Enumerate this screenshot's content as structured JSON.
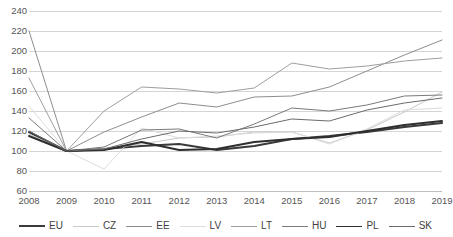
{
  "chart_data": {
    "type": "line",
    "title": "",
    "xlabel": "",
    "ylabel": "",
    "x": [
      2008,
      2009,
      2010,
      2011,
      2012,
      2013,
      2014,
      2015,
      2016,
      2017,
      2018,
      2019
    ],
    "xtick_labels": [
      "2008",
      "2009",
      "2010",
      "2011",
      "2012",
      "2013",
      "2014",
      "2015",
      "2016",
      "2017",
      "2018",
      "2019"
    ],
    "ylim": [
      60,
      240
    ],
    "ytick_labels": [
      "240",
      "220",
      "200",
      "180",
      "160",
      "140",
      "120",
      "100",
      "80",
      "60"
    ],
    "yticks": [
      240,
      220,
      200,
      180,
      160,
      140,
      120,
      100,
      80,
      60
    ],
    "grid": true,
    "legend_position": "bottom",
    "series": [
      {
        "name": "EU",
        "color": "#3a3a3a",
        "width": 2.1,
        "values": [
          119,
          100,
          102,
          105,
          107,
          101,
          105,
          112,
          115,
          119,
          124,
          128
        ]
      },
      {
        "name": "CZ",
        "color": "#c9c9c9",
        "width": 1.0,
        "values": [
          117,
          100,
          102,
          107,
          113,
          114,
          119,
          119,
          108,
          121,
          139,
          159
        ]
      },
      {
        "name": "EE",
        "color": "#8d8d8d",
        "width": 1.0,
        "values": [
          220,
          100,
          119,
          134,
          148,
          144,
          154,
          155,
          164,
          180,
          196,
          211
        ]
      },
      {
        "name": "LV",
        "color": "#dcdcdc",
        "width": 1.0,
        "values": [
          145,
          100,
          82,
          123,
          113,
          115,
          118,
          119,
          107,
          122,
          141,
          143
        ]
      },
      {
        "name": "LT",
        "color": "#9e9e9e",
        "width": 1.0,
        "values": [
          173,
          100,
          140,
          164,
          162,
          158,
          163,
          188,
          182,
          185,
          190,
          193
        ]
      },
      {
        "name": "HU",
        "color": "#7a7a7a",
        "width": 1.0,
        "values": [
          133,
          100,
          104,
          121,
          122,
          113,
          127,
          143,
          140,
          146,
          155,
          156
        ]
      },
      {
        "name": "PL",
        "color": "#2e2e2e",
        "width": 1.9,
        "values": [
          115,
          100,
          101,
          109,
          101,
          102,
          109,
          112,
          114,
          120,
          126,
          130
        ]
      },
      {
        "name": "SK",
        "color": "#6b6b6b",
        "width": 1.0,
        "values": [
          120,
          100,
          102,
          112,
          120,
          118,
          124,
          132,
          130,
          141,
          148,
          153
        ]
      }
    ]
  },
  "legend": {
    "items": [
      {
        "label": "EU"
      },
      {
        "label": "CZ"
      },
      {
        "label": "EE"
      },
      {
        "label": "LV"
      },
      {
        "label": "LT"
      },
      {
        "label": "HU"
      },
      {
        "label": "PL"
      },
      {
        "label": "SK"
      }
    ]
  }
}
